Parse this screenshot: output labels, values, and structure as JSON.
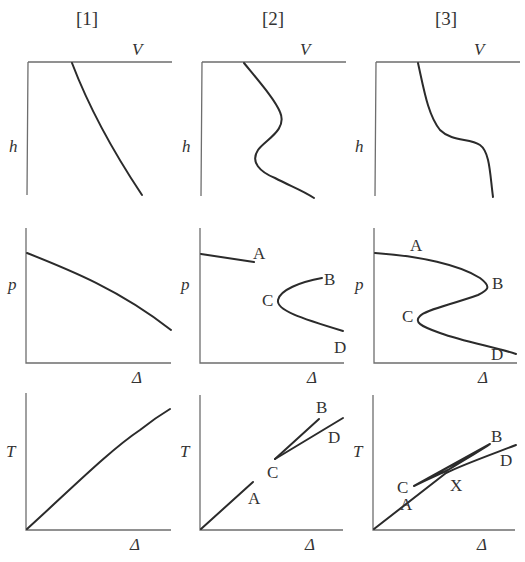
{
  "columns": [
    {
      "label": "[1]"
    },
    {
      "label": "[2]"
    },
    {
      "label": "[3]"
    }
  ],
  "axes": {
    "top_row": {
      "x_label": "V",
      "y_label": "h"
    },
    "middle_row": {
      "x_label": "Δ",
      "y_label": "p"
    },
    "bottom_row": {
      "x_label": "Δ",
      "y_label": "T"
    }
  },
  "points": {
    "col2_p": {
      "A": "A",
      "B": "B",
      "C": "C",
      "D": "D"
    },
    "col2_T": {
      "A": "A",
      "B": "B",
      "C": "C",
      "D": "D"
    },
    "col3_p": {
      "A": "A",
      "B": "B",
      "C": "C",
      "D": "D"
    },
    "col3_T": {
      "A": "A",
      "B": "B",
      "C": "C",
      "D": "D",
      "X": "X"
    }
  },
  "colors": {
    "axis": "#6e6e6e",
    "curve": "#2b2b2b",
    "background": "#ffffff"
  }
}
